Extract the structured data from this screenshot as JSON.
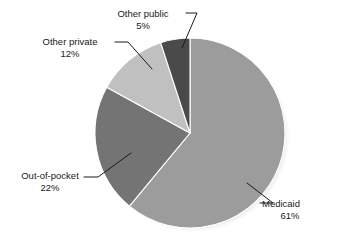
{
  "chart_data": {
    "type": "pie",
    "title": "",
    "subtitle": "",
    "xlabel": "",
    "ylabel": "",
    "legend_position": "none",
    "grid": false,
    "labels_mode": "callout-with-leader-lines",
    "start_angle_deg": 0,
    "direction": "clockwise",
    "categories": [
      "Medicaid",
      "Out-of-pocket",
      "Other private",
      "Other public"
    ],
    "values": [
      61,
      22,
      12,
      5
    ],
    "value_unit": "%",
    "colors": [
      "#9c9c9c",
      "#747474",
      "#c0c0c0",
      "#4a4a4a"
    ],
    "slices": [
      {
        "name": "Medicaid",
        "value": 61,
        "value_text": "61%",
        "color": "#9c9c9c",
        "start_deg": 0,
        "end_deg": 219.6
      },
      {
        "name": "Out-of-pocket",
        "value": 22,
        "value_text": "22%",
        "color": "#747474",
        "start_deg": 219.6,
        "end_deg": 298.8
      },
      {
        "name": "Other private",
        "value": 12,
        "value_text": "12%",
        "color": "#c0c0c0",
        "start_deg": 298.8,
        "end_deg": 342.0
      },
      {
        "name": "Other public",
        "value": 5,
        "value_text": "5%",
        "color": "#4a4a4a",
        "start_deg": 342.0,
        "end_deg": 360.0
      }
    ]
  },
  "labels": {
    "other_public": {
      "name": "Other public",
      "pct": "5%"
    },
    "other_private": {
      "name": "Other private",
      "pct": "12%"
    },
    "out_of_pocket": {
      "name": "Out-of-pocket",
      "pct": "22%"
    },
    "medicaid": {
      "name": "Medicaid",
      "pct": "61%"
    }
  },
  "style": {
    "background": "#ffffff",
    "text_color": "#1a1a1a",
    "leader_line_color": "#1a1a1a",
    "shadow_color": "#d8d8d8"
  }
}
